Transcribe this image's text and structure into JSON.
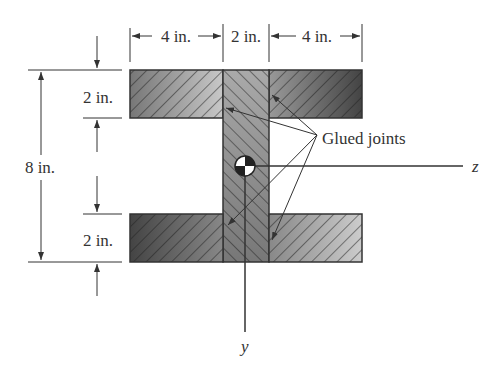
{
  "labels": {
    "top_left_width": "4 in.",
    "top_mid_width": "2 in.",
    "top_right_width": "4 in.",
    "top_flange_height": "2 in.",
    "bottom_flange_height": "2 in.",
    "total_height": "8 in.",
    "glued_joints": "Glued joints",
    "z_axis": "z",
    "y_axis": "y"
  },
  "colors": {
    "ink": "#333333",
    "fill_dark": "#555555",
    "fill_light": "#bbbbbb"
  }
}
